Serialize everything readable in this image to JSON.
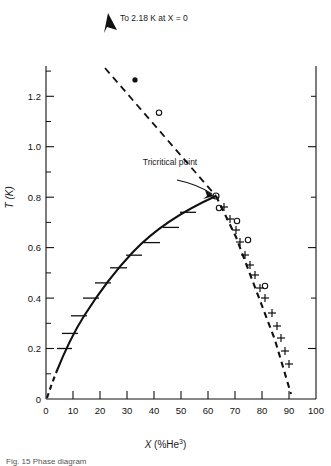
{
  "figure": {
    "axis_label_y": "T (K)",
    "axis_label_x_pre": "X (%",
    "axis_label_x_el": "He",
    "axis_label_x_sup": "3",
    "axis_label_x_post": ")",
    "annotation_lambda": "To 2.18 K at X = 0",
    "annotation_tricritical": "Tricritical point",
    "caption": "Fig. 15  Phase diagram",
    "ink": "#111111"
  },
  "chart_data": {
    "type": "scatter",
    "title": "",
    "xlabel": "X (%He3)",
    "ylabel": "T (K)",
    "xlim": [
      0,
      100
    ],
    "ylim": [
      0,
      1.32
    ],
    "grid": false,
    "legend": "none",
    "xticks": [
      0,
      10,
      20,
      30,
      40,
      50,
      60,
      70,
      80,
      90,
      100
    ],
    "xtick_labels": [
      "0",
      "10",
      "20",
      "30",
      "40",
      "50",
      "60",
      "70",
      "80",
      "90",
      "100"
    ],
    "yticks": [
      0,
      0.2,
      0.4,
      0.6,
      0.8,
      1.0,
      1.2
    ],
    "ytick_labels": [
      "0",
      "0.2",
      "0.4",
      "0.6",
      "0.8",
      "1.0",
      "1.2"
    ],
    "yminor": [
      0.1,
      0.3,
      0.5,
      0.7,
      0.9,
      1.1
    ],
    "tricritical_point": {
      "x": 63,
      "y": 0.82
    },
    "annotations": [
      {
        "text": "To 2.18 K at X = 0",
        "x": 23,
        "y": 1.31
      },
      {
        "text": "Tricritical point",
        "x": 41,
        "y": 0.9
      }
    ],
    "series": [
      {
        "name": "lambda line (dashed, extrapolated to 2.18 K at X=0)",
        "style": "dashed",
        "x": [
          22,
          63
        ],
        "y": [
          1.315,
          0.82
        ]
      },
      {
        "name": "lambda line data points",
        "style": "points",
        "markers": [
          "filled-circle",
          "open-circle"
        ],
        "x": [
          33,
          42
        ],
        "y": [
          1.265,
          1.135
        ]
      },
      {
        "name": "phase separation curve - left branch (solid with error bars)",
        "style": "solid",
        "x": [
          4,
          7,
          10,
          14,
          19,
          24,
          30,
          36,
          43,
          50,
          56,
          63
        ],
        "y": [
          0.1,
          0.2,
          0.26,
          0.33,
          0.4,
          0.46,
          0.52,
          0.57,
          0.62,
          0.68,
          0.74,
          0.82
        ]
      },
      {
        "name": "left branch error-bar markers",
        "style": "hbar",
        "x": [
          7,
          10,
          14,
          19,
          24,
          30,
          36,
          43,
          50,
          56
        ],
        "y": [
          0.2,
          0.26,
          0.33,
          0.4,
          0.46,
          0.52,
          0.57,
          0.62,
          0.68,
          0.74
        ]
      },
      {
        "name": "phase separation curve - right branch (dashed with plus markers)",
        "style": "dashed",
        "x": [
          63,
          98
        ],
        "y": [
          0.82,
          0.02
        ]
      },
      {
        "name": "right branch plus markers",
        "style": "plus",
        "x": [
          66,
          68,
          71,
          73,
          75,
          77,
          79,
          81,
          83,
          86,
          88,
          90,
          92,
          94
        ],
        "y": [
          0.76,
          0.71,
          0.67,
          0.62,
          0.57,
          0.53,
          0.49,
          0.44,
          0.4,
          0.34,
          0.29,
          0.24,
          0.19,
          0.14
        ]
      },
      {
        "name": "right side open-circle data points",
        "style": "open-circle",
        "x": [
          69,
          75,
          79,
          88
        ],
        "y": [
          0.71,
          0.66,
          0.59,
          0.34
        ]
      }
    ]
  }
}
